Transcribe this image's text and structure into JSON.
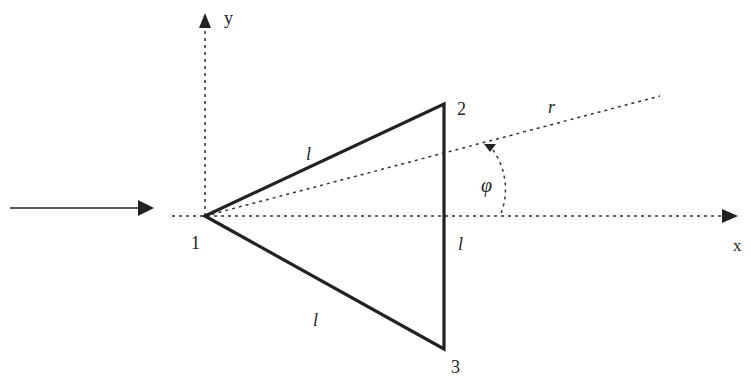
{
  "diagram": {
    "type": "geometry",
    "labels": {
      "y_axis": "y",
      "x_axis": "x",
      "vertex1": "1",
      "vertex2": "2",
      "vertex3": "3",
      "side_12": "l",
      "side_23": "l",
      "side_13": "l",
      "ray": "r",
      "angle": "φ"
    },
    "colors": {
      "stroke": "#222222",
      "background": "#ffffff"
    }
  }
}
